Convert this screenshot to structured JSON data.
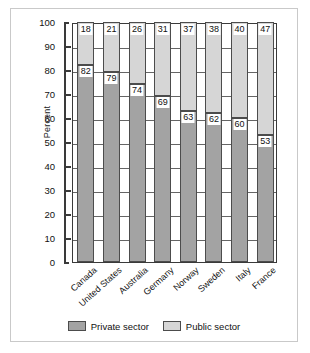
{
  "chart_data": {
    "type": "bar",
    "subtype": "stacked-bar-100",
    "title": "",
    "xlabel": "",
    "ylabel": "Percent",
    "ylim": [
      0,
      100
    ],
    "yticks": [
      100,
      90,
      80,
      70,
      60,
      50,
      40,
      30,
      20,
      10,
      0
    ],
    "grid": true,
    "legend_position": "bottom",
    "categories": [
      "Canada",
      "United States",
      "Australia",
      "Germany",
      "Norway",
      "Sweden",
      "Italy",
      "France"
    ],
    "series": [
      {
        "name": "Private sector",
        "color": "#a3a3a3",
        "values": [
          82,
          79,
          74,
          69,
          63,
          62,
          60,
          53
        ]
      },
      {
        "name": "Public sector",
        "color": "#d6d6d6",
        "values": [
          18,
          21,
          26,
          31,
          37,
          38,
          40,
          47
        ]
      }
    ]
  },
  "legend": {
    "items": [
      {
        "label": "Private sector",
        "color": "#a3a3a3"
      },
      {
        "label": "Public sector",
        "color": "#d6d6d6"
      }
    ]
  }
}
